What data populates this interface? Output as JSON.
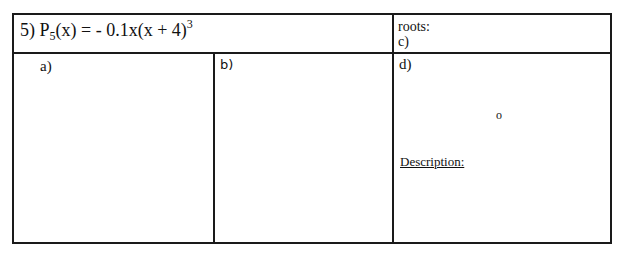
{
  "problem": {
    "number": "5)",
    "func_name": "P",
    "func_sub": "5",
    "func_rest": "(x) = - 0.1x(x + 4)",
    "exponent": "3"
  },
  "roots_section": {
    "roots_label": "roots:",
    "c_label": "c)"
  },
  "panels": {
    "a_label": "a)",
    "b_label": "b)",
    "d_label": "d)"
  },
  "number_line": {
    "origin_label": "o"
  },
  "description_label": "Description:",
  "graph_a": {
    "x_ticks_each_side": 8,
    "y_ticks_each_side": 8
  }
}
